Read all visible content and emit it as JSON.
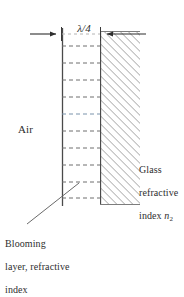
{
  "figure": {
    "type": "optics-schematic",
    "canvas": {
      "width": 184,
      "height": 272,
      "background": "#ffffff"
    },
    "colors": {
      "ink": "#2e2e2e",
      "boundary_line": "#4a4a4a",
      "dashed_line": "#6e6e6e",
      "hatch_line": "#8a8a8a",
      "arrow": "#2e2e2e",
      "leader": "#6a6a6a",
      "background": "#ffffff"
    }
  },
  "labels": {
    "thickness": {
      "text": "λ/4",
      "symbol": "λ",
      "denominator": "4",
      "meaning": "quarter wavelength layer thickness"
    },
    "air": {
      "text": "Air"
    },
    "glass": {
      "line1": "Glass",
      "line2": "refractive",
      "line3_prefix": "index ",
      "line3_symbol": "n",
      "line3_subscript": "2",
      "full_text": "Glass refractive index n2"
    },
    "blooming": {
      "line1": "Blooming",
      "line2": "layer, refractive",
      "line3": "index",
      "full_text": "Blooming layer, refractive index"
    }
  },
  "geometry": {
    "layer": {
      "name": "blooming-layer",
      "x_left": 62,
      "x_right": 100,
      "y_top": 28,
      "y_bottom": 206,
      "fill": "#ffffff",
      "internal_dashed_rows": 10
    },
    "glass": {
      "name": "glass-substrate",
      "x_left": 100,
      "x_right": 140,
      "y_top": 31,
      "y_bottom": 205,
      "hatch_angle_deg": 45,
      "hatch_spacing_px": 4
    },
    "dimension_arrows": {
      "y": 34,
      "left_arrow": {
        "from_x": 30,
        "to_x": 61,
        "direction": "right"
      },
      "right_arrow": {
        "from_x": 146,
        "to_x": 101,
        "direction": "left"
      }
    },
    "leader_line": {
      "from_x": 27,
      "from_y": 224,
      "to_x": 79,
      "to_y": 183
    }
  }
}
